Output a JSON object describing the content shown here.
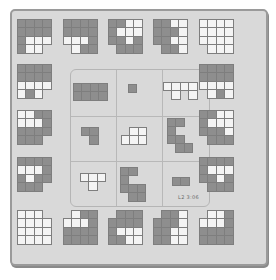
{
  "colors": {
    "board": "#d9d9d9",
    "dark": "#8e8e8e",
    "light": "#f4f4f4",
    "grid": "#7e7e7e"
  },
  "status_label": "L2 3:06",
  "outer_tiles": [
    {
      "name": "tile-r1-c1",
      "x": 17,
      "y": 19,
      "cell": 8.5,
      "rows": [
        "DDDD",
        "DDDD",
        "DLLL",
        "DLL."
      ]
    },
    {
      "name": "tile-r1-c2",
      "x": 63,
      "y": 19,
      "cell": 8.5,
      "rows": [
        "DDDD",
        "DDDD",
        "LLLD",
        ".LDD"
      ]
    },
    {
      "name": "tile-r1-c3",
      "x": 108,
      "y": 19,
      "cell": 8.5,
      "rows": [
        "DDLL",
        "DLLL",
        "DDLD",
        ".DDD"
      ]
    },
    {
      "name": "tile-r1-c4",
      "x": 153,
      "y": 19,
      "cell": 8.5,
      "rows": [
        "DDLL",
        "DDDL",
        "DDLL",
        ".DDL"
      ]
    },
    {
      "name": "tile-r1-c5",
      "x": 199,
      "y": 19,
      "cell": 8.5,
      "rows": [
        "LLLL",
        "LLLL",
        "LLLL",
        ".LLL"
      ]
    },
    {
      "name": "tile-r2-c1",
      "x": 17,
      "y": 64,
      "cell": 8.5,
      "rows": [
        "DDDD",
        "DDDD",
        "LLLL",
        "LDL."
      ]
    },
    {
      "name": "tile-r2-c5",
      "x": 199,
      "y": 64,
      "cell": 8.5,
      "rows": [
        "DDDD",
        "DDDD",
        "LLLL",
        ".LDL"
      ]
    },
    {
      "name": "tile-r3-c1",
      "x": 17,
      "y": 110,
      "cell": 8.5,
      "rows": [
        "LLDD",
        "LLLD",
        "DDDD",
        "DDD."
      ]
    },
    {
      "name": "tile-r3-c5",
      "x": 199,
      "y": 110,
      "cell": 8.5,
      "rows": [
        "DDLL",
        "DLLL",
        "DDDL",
        ".DDD"
      ]
    },
    {
      "name": "tile-r4-c1",
      "x": 17,
      "y": 157,
      "cell": 8.5,
      "rows": [
        "DDDD",
        "LLLD",
        "DLDD",
        "DDD."
      ]
    },
    {
      "name": "tile-r4-c5",
      "x": 199,
      "y": 157,
      "cell": 8.5,
      "rows": [
        "DDDD",
        "DLLL",
        "DDLD",
        ".DDD"
      ]
    },
    {
      "name": "tile-r5-c1",
      "x": 17,
      "y": 210,
      "cell": 8.5,
      "rows": [
        "LLL.",
        "LLLL",
        "LLLL",
        "LLLL"
      ]
    },
    {
      "name": "tile-r5-c2",
      "x": 63,
      "y": 210,
      "cell": 8.5,
      "rows": [
        ".LDD",
        "LLLD",
        "DDDD",
        "DDDD"
      ]
    },
    {
      "name": "tile-r5-c3",
      "x": 108,
      "y": 210,
      "cell": 8.5,
      "rows": [
        ".DDD",
        "DDDD",
        "DLLL",
        "DDLL"
      ]
    },
    {
      "name": "tile-r5-c4",
      "x": 153,
      "y": 210,
      "cell": 8.5,
      "rows": [
        ".DDL",
        "DDDL",
        "DDLL",
        "DDLL"
      ]
    },
    {
      "name": "tile-r5-c5",
      "x": 199,
      "y": 210,
      "cell": 8.5,
      "rows": [
        ".LLD",
        "LLLD",
        "DDDD",
        "DDDD"
      ]
    }
  ],
  "inner_pieces": [
    {
      "name": "piece-rectangle",
      "x": 73,
      "y": 83,
      "cell": 8.5,
      "rows": [
        "DDDD",
        "DDDD"
      ]
    },
    {
      "name": "piece-single",
      "x": 128,
      "y": 84,
      "cell": 8.5,
      "rows": [
        "D"
      ]
    },
    {
      "name": "piece-light-t",
      "x": 163,
      "y": 82,
      "cell": 8.5,
      "rows": [
        "LLLL",
        ".L.L"
      ]
    },
    {
      "name": "piece-dark-l",
      "x": 81,
      "y": 127,
      "cell": 8.5,
      "rows": [
        "DD",
        ".D"
      ]
    },
    {
      "name": "piece-light-step",
      "x": 121,
      "y": 127,
      "cell": 8.5,
      "rows": [
        ".LL",
        "LLL"
      ]
    },
    {
      "name": "piece-dark-s",
      "x": 167,
      "y": 118,
      "cell": 8.5,
      "rows": [
        "DD.",
        "D..",
        "DD.",
        ".DD"
      ]
    },
    {
      "name": "piece-light-t-small",
      "x": 80,
      "y": 173,
      "cell": 8.5,
      "rows": [
        "LLL",
        ".L."
      ]
    },
    {
      "name": "piece-dark-z",
      "x": 120,
      "y": 167,
      "cell": 8.5,
      "rows": [
        "DD.",
        "D..",
        "DDD",
        ".DD"
      ]
    },
    {
      "name": "piece-small-rect",
      "x": 172,
      "y": 177,
      "cell": 8.5,
      "rows": [
        "DD"
      ]
    }
  ]
}
